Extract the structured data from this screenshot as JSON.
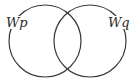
{
  "diagram": {
    "type": "venn",
    "stroke_color": "#3a3a3a",
    "background": "#ffffff",
    "sets": [
      {
        "id": "p",
        "label": "Wp",
        "cx": 45,
        "cy": 41,
        "r": 36
      },
      {
        "id": "q",
        "label": "Wq",
        "cx": 90,
        "cy": 41,
        "r": 36
      }
    ]
  }
}
